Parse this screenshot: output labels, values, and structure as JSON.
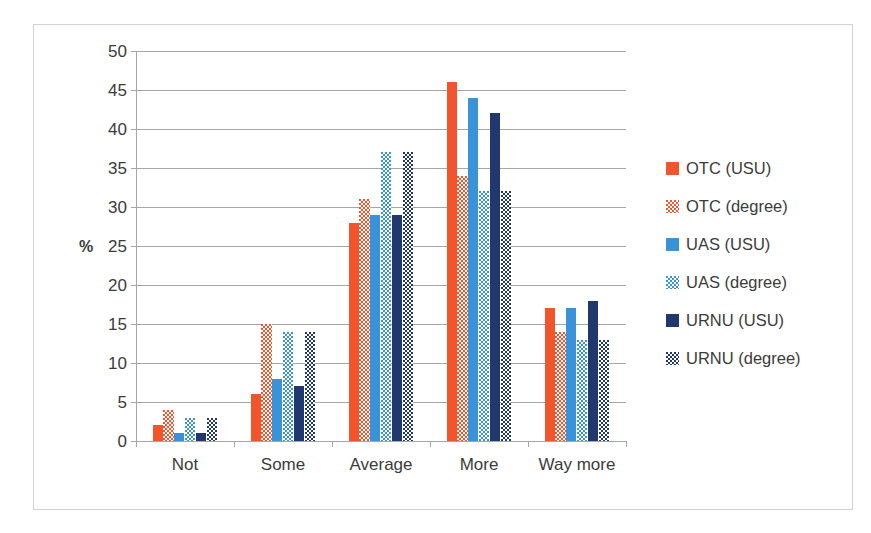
{
  "chart_data": {
    "type": "bar",
    "title": "",
    "xlabel": "",
    "ylabel": "%",
    "ylim": [
      0,
      50
    ],
    "ytick_step": 5,
    "yticks": [
      50,
      45,
      40,
      35,
      30,
      25,
      20,
      15,
      10,
      5,
      0
    ],
    "grid": true,
    "legend_position": "right",
    "categories": [
      "Not",
      "Some",
      "Average",
      "More",
      "Way more"
    ],
    "series": [
      {
        "name": "OTC (USU)",
        "color": "#f2552c",
        "pattern": "solid",
        "values": [
          2,
          6,
          28,
          46,
          17
        ]
      },
      {
        "name": "OTC (degree)",
        "color": "#f2552c",
        "pattern": "checkered",
        "values": [
          4,
          15,
          31,
          34,
          14
        ]
      },
      {
        "name": "UAS (USU)",
        "color": "#3a92d8",
        "pattern": "solid",
        "values": [
          1,
          8,
          29,
          44,
          17
        ]
      },
      {
        "name": "UAS (degree)",
        "color": "#3a92d8",
        "pattern": "checkered",
        "values": [
          3,
          14,
          37,
          32,
          13
        ]
      },
      {
        "name": "URNU (USU)",
        "color": "#20386e",
        "pattern": "solid",
        "values": [
          1,
          7,
          29,
          42,
          18
        ]
      },
      {
        "name": "URNU (degree)",
        "color": "#20386e",
        "pattern": "checkered",
        "values": [
          3,
          14,
          37,
          32,
          13
        ]
      }
    ]
  },
  "legend": {
    "items": [
      {
        "label": "OTC (USU)"
      },
      {
        "label": "OTC (degree)"
      },
      {
        "label": "UAS (USU)"
      },
      {
        "label": "UAS (degree)"
      },
      {
        "label": "URNU (USU)"
      },
      {
        "label": "URNU (degree)"
      }
    ]
  },
  "axis": {
    "y_title": "%"
  },
  "caption": {
    "text": ""
  }
}
